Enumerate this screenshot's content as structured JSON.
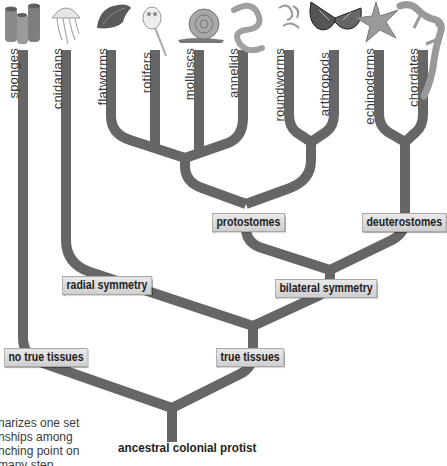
{
  "diagram": {
    "type": "phylogenetic-tree",
    "branch_color": "#666666",
    "root": "ancestral colonial protist",
    "taxa": [
      {
        "name": "sponges",
        "icon": "sponge-icon",
        "x": 23
      },
      {
        "name": "cnidarians",
        "icon": "jellyfish-icon",
        "x": 66
      },
      {
        "name": "flatworms",
        "icon": "flatworm-icon",
        "x": 111
      },
      {
        "name": "rotifers",
        "icon": "rotifer-icon",
        "x": 155
      },
      {
        "name": "molluscs",
        "icon": "snail-icon",
        "x": 199
      },
      {
        "name": "annelids",
        "icon": "worm-icon",
        "x": 243
      },
      {
        "name": "roundworms",
        "icon": "roundworm-icon",
        "x": 289
      },
      {
        "name": "arthropods",
        "icon": "butterfly-icon",
        "x": 334
      },
      {
        "name": "echinoderms",
        "icon": "starfish-icon",
        "x": 379
      },
      {
        "name": "chordates",
        "icon": "lizard-icon",
        "x": 423
      }
    ],
    "nodes": [
      {
        "label": "no true tissues"
      },
      {
        "label": "true tissues"
      },
      {
        "label": "radial symmetry"
      },
      {
        "label": "bilateral symmetry"
      },
      {
        "label": "protostomes"
      },
      {
        "label": "deuterostomes"
      }
    ],
    "caption_lines": [
      "narizes one set",
      "nships among",
      "nching point on",
      "many step"
    ]
  }
}
